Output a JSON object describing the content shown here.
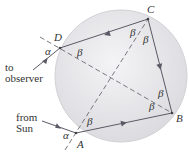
{
  "diagram": {
    "points": {
      "A": "A",
      "B": "B",
      "C": "C",
      "D": "D"
    },
    "angles": {
      "alpha": "α",
      "beta": "β"
    },
    "labels": {
      "to_observer_line1": "to",
      "to_observer_line2": "observer",
      "from_sun_line1": "from",
      "from_sun_line2": "Sun"
    },
    "colors": {
      "drop_fill": "#e6e6e8",
      "drop_edge": "#cfcfd3",
      "ray": "#5a5a66",
      "dashed": "#6a6a70",
      "text": "#333333"
    }
  }
}
